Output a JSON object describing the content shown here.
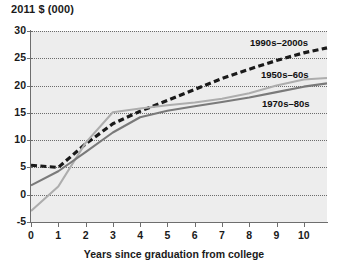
{
  "chart_data": {
    "type": "line",
    "title": "",
    "ylabel": "2011 $ (000)",
    "xlabel": "Years since graduation from college",
    "xlim": [
      0,
      10.85
    ],
    "ylim": [
      -5,
      30
    ],
    "yticks": [
      -5,
      0,
      5,
      10,
      15,
      20,
      25,
      30
    ],
    "xticks": [
      0,
      1,
      2,
      3,
      4,
      5,
      6,
      7,
      8,
      9,
      10
    ],
    "grid": "horizontal-dotted",
    "legend": "inline-labels",
    "x": [
      0,
      1,
      2,
      3,
      4,
      5,
      6,
      7,
      8,
      9,
      10,
      10.85
    ],
    "series": [
      {
        "name": "1990s-2000s",
        "style": "dashed",
        "color": "#1a1a1a",
        "values": [
          5.4,
          5.0,
          9.3,
          13.0,
          15.3,
          17.3,
          19.3,
          21.3,
          23.0,
          24.6,
          26.0,
          26.9
        ]
      },
      {
        "name": "1950s-60s",
        "style": "solid",
        "color": "#adadad",
        "values": [
          -3.0,
          1.5,
          9.5,
          15.1,
          15.8,
          16.4,
          16.9,
          17.6,
          18.6,
          20.0,
          21.1,
          21.4
        ]
      },
      {
        "name": "1970s-80s",
        "style": "solid",
        "color": "#7a7a7a",
        "values": [
          1.7,
          4.3,
          7.8,
          11.4,
          14.2,
          15.4,
          16.2,
          17.0,
          17.8,
          18.8,
          19.8,
          20.4
        ]
      }
    ],
    "tick_labels": {
      "y": [
        "30",
        "25",
        "20",
        "15",
        "10",
        "5",
        "0",
        "-5"
      ],
      "x": [
        "0",
        "1",
        "2",
        "3",
        "4",
        "5",
        "6",
        "7",
        "8",
        "9",
        "10"
      ]
    },
    "series_label_positions": [
      {
        "name": "1990s-2000s",
        "left": 250,
        "top": 37
      },
      {
        "name": "1950s-60s",
        "left": 261,
        "top": 69
      },
      {
        "name": "1970s-80s",
        "left": 262,
        "top": 98
      }
    ]
  }
}
